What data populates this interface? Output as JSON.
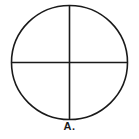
{
  "figure": {
    "label": "A.",
    "stroke_color": "#1a1a1a",
    "background": "#ffffff",
    "shape": "circle divided into four quadrants by a vertical and horizontal line"
  }
}
